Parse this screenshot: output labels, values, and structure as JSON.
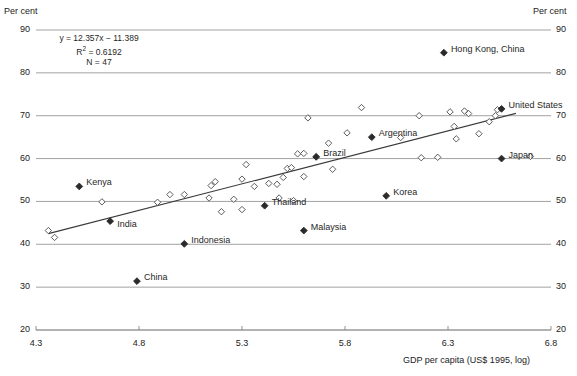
{
  "chart_data": {
    "type": "scatter",
    "title": "",
    "xlabel": "GDP per capita (US$ 1995, log)",
    "ylabel": "Per cent",
    "ylabel_right": "Per cent",
    "xlim": [
      4.3,
      6.8
    ],
    "ylim": [
      20,
      90
    ],
    "xticks": [
      "4.3",
      "4.8",
      "5.3",
      "5.8",
      "6.3",
      "6.8"
    ],
    "yticks": [
      "90",
      "80",
      "70",
      "60",
      "50",
      "40",
      "30",
      "20"
    ],
    "grid": true,
    "legend": "none",
    "annotations": {
      "equation": "y = 12.357x − 11.389",
      "r_squared_prefix": "R",
      "r_squared_sup": "2",
      "r_squared_value": " = 0.6192",
      "n": "N = 47"
    },
    "trendline": {
      "slope": 12.357,
      "intercept": -11.389,
      "x_start": 4.36,
      "x_end": 6.63
    },
    "labeled_points": [
      {
        "name": "Hong Kong, China",
        "x": 6.28,
        "y": 84.7,
        "marker": "solid",
        "label_dx": 7,
        "label_dy": -4
      },
      {
        "name": "United States",
        "x": 6.56,
        "y": 71.6,
        "marker": "solid",
        "label_dx": 7,
        "label_dy": -4
      },
      {
        "name": "Argentina",
        "x": 5.93,
        "y": 65.0,
        "marker": "solid",
        "label_dx": 7,
        "label_dy": -4
      },
      {
        "name": "Brazil",
        "x": 5.66,
        "y": 60.4,
        "marker": "solid",
        "label_dx": 7,
        "label_dy": -4
      },
      {
        "name": "Japan",
        "x": 6.56,
        "y": 60.0,
        "marker": "solid",
        "label_dx": 7,
        "label_dy": -4
      },
      {
        "name": "Korea",
        "x": 6.0,
        "y": 51.3,
        "marker": "solid",
        "label_dx": 7,
        "label_dy": -4
      },
      {
        "name": "Kenya",
        "x": 4.51,
        "y": 53.5,
        "marker": "solid",
        "label_dx": 7,
        "label_dy": -4
      },
      {
        "name": "Thailand",
        "x": 5.41,
        "y": 49.0,
        "marker": "solid",
        "label_dx": 7,
        "label_dy": -4
      },
      {
        "name": "Malaysia",
        "x": 5.6,
        "y": 43.2,
        "marker": "solid",
        "label_dx": 7,
        "label_dy": -4
      },
      {
        "name": "India",
        "x": 4.66,
        "y": 45.4,
        "marker": "solid",
        "label_dx": 7,
        "label_dy": 3
      },
      {
        "name": "Indonesia",
        "x": 5.02,
        "y": 40.1,
        "marker": "solid",
        "label_dx": 7,
        "label_dy": -4
      },
      {
        "name": "China",
        "x": 4.79,
        "y": 31.4,
        "marker": "solid",
        "label_dx": 7,
        "label_dy": -4
      }
    ],
    "unlabeled_points": [
      {
        "x": 4.36,
        "y": 43.2
      },
      {
        "x": 4.39,
        "y": 41.6
      },
      {
        "x": 4.62,
        "y": 49.9
      },
      {
        "x": 4.89,
        "y": 49.8
      },
      {
        "x": 5.02,
        "y": 51.6
      },
      {
        "x": 5.14,
        "y": 50.8
      },
      {
        "x": 5.15,
        "y": 53.7
      },
      {
        "x": 5.17,
        "y": 54.6
      },
      {
        "x": 5.26,
        "y": 50.5
      },
      {
        "x": 5.3,
        "y": 55.2
      },
      {
        "x": 5.32,
        "y": 58.6
      },
      {
        "x": 5.36,
        "y": 53.5
      },
      {
        "x": 5.43,
        "y": 54.2
      },
      {
        "x": 5.47,
        "y": 54.0
      },
      {
        "x": 5.5,
        "y": 55.6
      },
      {
        "x": 5.52,
        "y": 57.7
      },
      {
        "x": 5.54,
        "y": 57.9
      },
      {
        "x": 5.57,
        "y": 61.1
      },
      {
        "x": 5.6,
        "y": 61.2
      },
      {
        "x": 5.6,
        "y": 55.8
      },
      {
        "x": 5.62,
        "y": 69.5
      },
      {
        "x": 5.66,
        "y": 60.4
      },
      {
        "x": 5.72,
        "y": 63.6
      },
      {
        "x": 5.74,
        "y": 57.5
      },
      {
        "x": 5.81,
        "y": 66.0
      },
      {
        "x": 5.88,
        "y": 71.9
      },
      {
        "x": 6.07,
        "y": 64.9
      },
      {
        "x": 6.16,
        "y": 70.0
      },
      {
        "x": 6.17,
        "y": 60.2
      },
      {
        "x": 6.25,
        "y": 60.3
      },
      {
        "x": 6.31,
        "y": 70.9
      },
      {
        "x": 6.33,
        "y": 67.5
      },
      {
        "x": 6.34,
        "y": 64.6
      },
      {
        "x": 6.38,
        "y": 71.1
      },
      {
        "x": 6.4,
        "y": 70.5
      },
      {
        "x": 6.45,
        "y": 65.8
      },
      {
        "x": 6.5,
        "y": 68.6
      },
      {
        "x": 6.53,
        "y": 70.0
      },
      {
        "x": 6.54,
        "y": 71.4
      },
      {
        "x": 6.7,
        "y": 60.5
      },
      {
        "x": 5.3,
        "y": 48.1
      },
      {
        "x": 5.2,
        "y": 47.6
      },
      {
        "x": 4.95,
        "y": 51.6
      },
      {
        "x": 5.48,
        "y": 50.8
      },
      {
        "x": 5.55,
        "y": 50.2
      }
    ]
  }
}
